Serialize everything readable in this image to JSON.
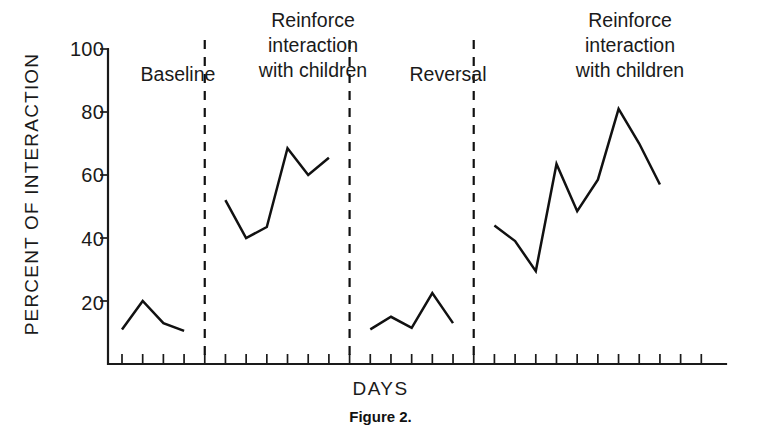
{
  "chart_data": {
    "type": "line",
    "title": "Figure 2.",
    "xlabel": "DAYS",
    "ylabel": "PERCENT OF INTERACTION",
    "ylim": [
      0,
      100
    ],
    "yticks": [
      20,
      40,
      60,
      80,
      100
    ],
    "grid": false,
    "legend": "none",
    "x_tick_count": 29,
    "axis_note": "x axis shows unlabeled day tick marks; phases separated by vertical dashed lines",
    "phases": [
      {
        "name": "baseline",
        "label": "Baseline",
        "x": [
          1,
          2,
          3,
          4
        ],
        "values": [
          11,
          20,
          13,
          10.5
        ]
      },
      {
        "name": "reinforce-1",
        "label": "Reinforce\ninteraction\nwith children",
        "x": [
          6,
          7,
          8,
          9,
          10,
          11
        ],
        "values": [
          52,
          40,
          43.5,
          68.5,
          60,
          65.5
        ]
      },
      {
        "name": "reversal",
        "label": "Reversal",
        "x": [
          13,
          14,
          15,
          16,
          17
        ],
        "values": [
          11,
          15,
          11.5,
          22.5,
          13
        ]
      },
      {
        "name": "reinforce-2",
        "label": "Reinforce\ninteraction\nwith children",
        "x": [
          19,
          20,
          21,
          22,
          23,
          24,
          25,
          26,
          27
        ],
        "values": [
          44,
          39,
          29.5,
          63.5,
          48.5,
          58.5,
          81,
          70,
          57
        ]
      }
    ],
    "dividers_after_x": [
      5,
      12,
      18
    ]
  },
  "labels": {
    "ytick_100": "100",
    "ytick_80": "80",
    "ytick_60": "60",
    "ytick_40": "40",
    "ytick_20": "20",
    "yaxis_title": "PERCENT OF INTERACTION",
    "xaxis_title": "DAYS",
    "caption": "Figure 2.",
    "phase1": "Baseline",
    "phase2_line1": "Reinforce",
    "phase2_line2": "interaction",
    "phase2_line3": "with children",
    "phase3": "Reversal",
    "phase4_line1": "Reinforce",
    "phase4_line2": "interaction",
    "phase4_line3": "with children"
  },
  "colors": {
    "ink": "#111111",
    "background": "#ffffff"
  }
}
